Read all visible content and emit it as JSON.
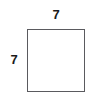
{
  "figure": {
    "type": "square-with-dimension-labels",
    "shape": {
      "name": "square",
      "fill_color": "#ffffff",
      "stroke_color": "#5a5a5e"
    },
    "labels": {
      "top": "7",
      "left": "7"
    },
    "text_color": "#1a1a1a",
    "background_color": "#ffffff"
  }
}
